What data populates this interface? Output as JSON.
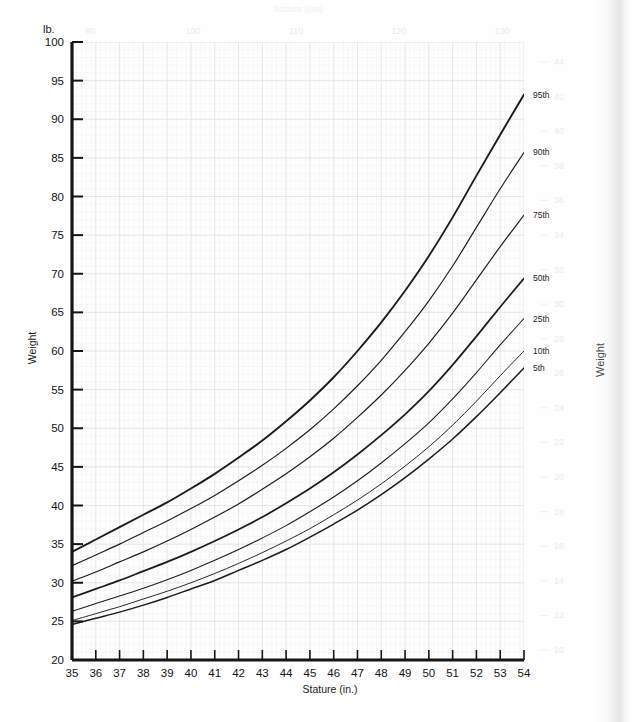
{
  "page": {
    "background_color": "#fefefe",
    "edge_shadow": true
  },
  "chart_data": {
    "type": "line",
    "title": "",
    "xlabel": "Stature (in.)",
    "ylabel": "Weight",
    "y_unit_label": "lb.",
    "xlim": [
      35,
      54
    ],
    "ylim": [
      20,
      100
    ],
    "grid": true,
    "legend": "right-inline",
    "x_ticks": [
      35,
      36,
      37,
      38,
      39,
      40,
      41,
      42,
      43,
      44,
      45,
      46,
      47,
      48,
      49,
      50,
      51,
      52,
      53,
      54
    ],
    "y_ticks": [
      20,
      25,
      30,
      35,
      40,
      45,
      50,
      55,
      60,
      65,
      70,
      75,
      80,
      85,
      90,
      95,
      100
    ],
    "x": [
      35,
      36,
      37,
      38,
      39,
      40,
      41,
      42,
      43,
      44,
      45,
      46,
      47,
      48,
      49,
      50,
      51,
      52,
      53,
      54
    ],
    "series": [
      {
        "name": "95th",
        "label": "95th",
        "color": "#1c1c1c",
        "width": 1.9,
        "values": [
          34.0,
          35.6,
          37.2,
          38.8,
          40.4,
          42.2,
          44.1,
          46.2,
          48.4,
          50.9,
          53.6,
          56.6,
          60.0,
          63.7,
          67.8,
          72.3,
          77.3,
          82.7,
          88.0,
          93.2
        ]
      },
      {
        "name": "90th",
        "label": "90th",
        "color": "#1c1c1c",
        "width": 1.15,
        "values": [
          32.2,
          33.6,
          35.0,
          36.5,
          38.0,
          39.6,
          41.3,
          43.2,
          45.2,
          47.4,
          49.8,
          52.5,
          55.5,
          58.8,
          62.5,
          66.5,
          71.0,
          76.0,
          81.0,
          85.7
        ]
      },
      {
        "name": "75th",
        "label": "75th",
        "color": "#1c1c1c",
        "width": 1.15,
        "values": [
          30.2,
          31.4,
          32.7,
          34.0,
          35.4,
          36.9,
          38.5,
          40.2,
          42.1,
          44.1,
          46.3,
          48.7,
          51.4,
          54.3,
          57.5,
          61.0,
          64.9,
          69.2,
          73.5,
          77.6
        ]
      },
      {
        "name": "50th",
        "label": "50th",
        "color": "#1c1c1c",
        "width": 1.75,
        "values": [
          28.1,
          29.2,
          30.3,
          31.5,
          32.7,
          34.0,
          35.4,
          36.9,
          38.5,
          40.3,
          42.2,
          44.3,
          46.6,
          49.1,
          51.8,
          54.8,
          58.2,
          61.9,
          65.7,
          69.4
        ]
      },
      {
        "name": "25th",
        "label": "25th",
        "color": "#1c1c1c",
        "width": 1.05,
        "values": [
          26.3,
          27.3,
          28.3,
          29.3,
          30.4,
          31.6,
          32.9,
          34.3,
          35.8,
          37.4,
          39.2,
          41.1,
          43.2,
          45.5,
          48.0,
          50.7,
          53.8,
          57.2,
          60.8,
          64.2
        ]
      },
      {
        "name": "10th",
        "label": "10th",
        "color": "#1c1c1c",
        "width": 0.95,
        "values": [
          25.1,
          26.0,
          26.9,
          27.9,
          28.9,
          30.0,
          31.2,
          32.5,
          33.9,
          35.4,
          37.0,
          38.8,
          40.7,
          42.8,
          45.1,
          47.6,
          50.4,
          53.5,
          56.8,
          60.0
        ]
      },
      {
        "name": "5th",
        "label": "5th",
        "color": "#1c1c1c",
        "width": 1.5,
        "values": [
          24.6,
          25.4,
          26.2,
          27.1,
          28.1,
          29.2,
          30.3,
          31.6,
          32.9,
          34.3,
          35.9,
          37.6,
          39.4,
          41.4,
          43.6,
          46.0,
          48.6,
          51.5,
          54.6,
          57.8
        ]
      }
    ],
    "secondary_axes": {
      "right": {
        "label": "Weight",
        "unit": "kg",
        "ticks": [
          "44",
          "42",
          "40",
          "38",
          "36",
          "34",
          "32",
          "30",
          "28",
          "26",
          "24",
          "22",
          "20",
          "18",
          "16",
          "14",
          "12",
          "10"
        ]
      },
      "top": {
        "label": "Stature (cm)",
        "ticks": [
          "90",
          "100",
          "110",
          "120",
          "130"
        ]
      }
    }
  }
}
